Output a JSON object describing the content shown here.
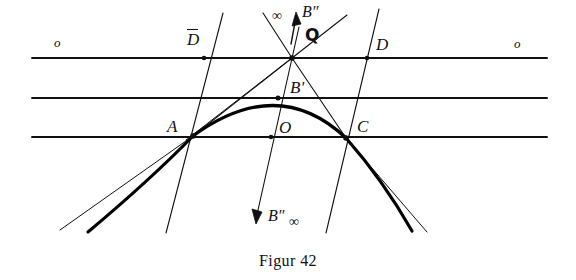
{
  "figure": {
    "caption": "Figur 42",
    "labels": {
      "o_left": "o",
      "o_right": "o",
      "D_bar": "D",
      "D": "D",
      "Q": "Q",
      "A": "A",
      "B_prime": "B'",
      "B_double_prime_top": "B″",
      "B_double_prime_bottom": "B″",
      "O": "O",
      "C": "C",
      "infinity_top": "∞",
      "infinity_bottom": "∞"
    },
    "colors": {
      "ink": "#111111",
      "background": "#ffffff",
      "curve": "#000000"
    },
    "geometry": {
      "points": {
        "Q": [
          292,
          58
        ],
        "D_bar": [
          204,
          58
        ],
        "D": [
          367,
          58
        ],
        "B_prime": [
          278,
          98
        ],
        "A": [
          193,
          136
        ],
        "O": [
          271,
          137
        ],
        "C": [
          346,
          138
        ]
      },
      "horizontal_lines_y": [
        58,
        98,
        137
      ],
      "horizontal_extent_x": [
        32,
        547
      ]
    }
  }
}
